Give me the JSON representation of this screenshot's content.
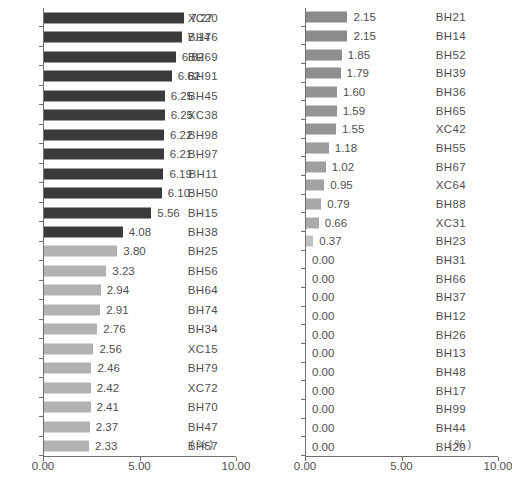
{
  "chart_data": {
    "type": "bar",
    "title": "",
    "xlabel": "( % )",
    "ylabel": "",
    "xlim": [
      0,
      10
    ],
    "orientation": "horizontal",
    "grid": false,
    "legend": "none",
    "xticks": [
      "0.00",
      "5.00",
      "10.00"
    ],
    "xtick_values": [
      0,
      5,
      10
    ],
    "unit": "( % )",
    "panels": [
      {
        "name": "left-panel",
        "categories": [
          "XC20",
          "BH76",
          "BH69",
          "BH91",
          "BH45",
          "XC38",
          "BH98",
          "BH97",
          "BH11",
          "BH50",
          "BH15",
          "BH38",
          "BH25",
          "BH56",
          "BH64",
          "BH74",
          "BH34",
          "XC15",
          "BH79",
          "XC72",
          "BH70",
          "BH47",
          "BH57"
        ],
        "values": [
          7.27,
          7.14,
          6.82,
          6.62,
          6.25,
          6.25,
          6.22,
          6.21,
          6.19,
          6.1,
          5.56,
          4.08,
          3.8,
          3.23,
          2.94,
          2.91,
          2.76,
          2.56,
          2.46,
          2.42,
          2.41,
          2.37,
          2.33
        ],
        "labels": [
          "7.27",
          "7.14",
          "6.82",
          "6.62",
          "6.25",
          "6.25",
          "6.22",
          "6.21",
          "6.19",
          "6.10",
          "5.56",
          "4.08",
          "3.80",
          "3.23",
          "2.94",
          "2.91",
          "2.76",
          "2.56",
          "2.46",
          "2.42",
          "2.41",
          "2.37",
          "2.33"
        ],
        "colors": [
          "#3b3b3b",
          "#3b3b3b",
          "#3b3b3b",
          "#3b3b3b",
          "#3b3b3b",
          "#3b3b3b",
          "#3b3b3b",
          "#3b3b3b",
          "#3b3b3b",
          "#3b3b3b",
          "#3b3b3b",
          "#3b3b3b",
          "#b2b2b2",
          "#b2b2b2",
          "#b2b2b2",
          "#b2b2b2",
          "#b2b2b2",
          "#b2b2b2",
          "#b2b2b2",
          "#b2b2b2",
          "#b2b2b2",
          "#b2b2b2",
          "#b2b2b2"
        ]
      },
      {
        "name": "right-panel",
        "categories": [
          "BH21",
          "BH14",
          "BH52",
          "BH39",
          "BH36",
          "BH65",
          "XC42",
          "BH55",
          "BH67",
          "XC64",
          "BH88",
          "XC31",
          "BH23",
          "BH31",
          "BH66",
          "BH37",
          "BH12",
          "BH26",
          "BH13",
          "BH48",
          "BH17",
          "BH99",
          "BH44",
          "BH20"
        ],
        "values": [
          2.15,
          2.15,
          1.85,
          1.79,
          1.6,
          1.59,
          1.55,
          1.18,
          1.02,
          0.95,
          0.79,
          0.66,
          0.37,
          0.0,
          0.0,
          0.0,
          0.0,
          0.0,
          0.0,
          0.0,
          0.0,
          0.0,
          0.0,
          0.0
        ],
        "labels": [
          "2.15",
          "2.15",
          "1.85",
          "1.79",
          "1.60",
          "1.59",
          "1.55",
          "1.18",
          "1.02",
          "0.95",
          "0.79",
          "0.66",
          "0.37",
          "0.00",
          "0.00",
          "0.00",
          "0.00",
          "0.00",
          "0.00",
          "0.00",
          "0.00",
          "0.00",
          "0.00",
          "0.00"
        ],
        "colors": [
          "#8b8b8b",
          "#8b8b8b",
          "#8f8f8f",
          "#8f8f8f",
          "#949494",
          "#949494",
          "#949494",
          "#9c9c9c",
          "#a0a0a0",
          "#a3a3a3",
          "#a8a8a8",
          "#ababab",
          "#c0c0c0",
          "#c0c0c0",
          "#c0c0c0",
          "#c0c0c0",
          "#c0c0c0",
          "#c0c0c0",
          "#c0c0c0",
          "#c0c0c0",
          "#c0c0c0",
          "#c0c0c0",
          "#c0c0c0",
          "#c0c0c0"
        ]
      }
    ]
  },
  "axis": {
    "unit_left": "( % )",
    "unit_right": "( % )"
  }
}
